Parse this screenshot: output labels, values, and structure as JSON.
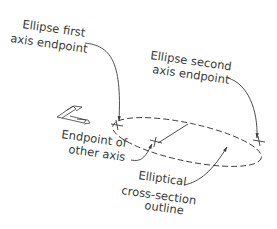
{
  "diagram": {
    "type": "technical-illustration",
    "labels": {
      "first_axis": [
        "Ellipse first",
        "axis endpoint"
      ],
      "second_axis": [
        "Ellipse second",
        "axis endpoint"
      ],
      "other_axis": [
        "Endpoint of",
        "other axis"
      ],
      "outline": [
        "Elliptical",
        "cross-section",
        "outline"
      ]
    },
    "colors": {
      "line": "#3a3a3a",
      "background": "#ffffff"
    }
  }
}
